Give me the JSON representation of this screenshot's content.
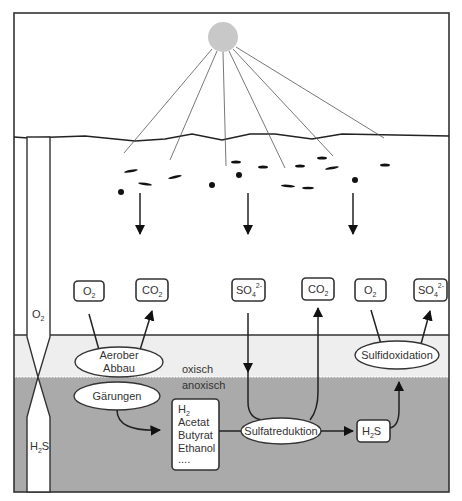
{
  "diagram": {
    "zones": {
      "oxic_label": "oxisch",
      "anoxic_label": "anoxisch"
    },
    "gradient_column": {
      "top_label": "O",
      "top_sub": "2",
      "bottom_label_a": "H",
      "bottom_sub": "2",
      "bottom_label_b": "S"
    },
    "boxes": {
      "o2_left": {
        "main": "O",
        "sub": "2"
      },
      "co2_left": {
        "main": "CO",
        "sub": "2"
      },
      "so4_left": {
        "main": "SO",
        "sub": "4",
        "sup": "2-"
      },
      "co2_mid": {
        "main": "CO",
        "sub": "2"
      },
      "o2_right": {
        "main": "O",
        "sub": "2"
      },
      "so4_right": {
        "main": "SO",
        "sub": "4",
        "sup": "2-"
      },
      "h2s": {
        "main_a": "H",
        "sub": "2",
        "main_b": "S"
      },
      "products": {
        "h2_main": "H",
        "h2_sub": "2",
        "items": [
          "Acetat",
          "Butyrat",
          "Ethanol",
          "...."
        ]
      }
    },
    "processes": {
      "aerober_abbau_line1": "Aerober",
      "aerober_abbau_line2": "Abbau",
      "gaerungen": "Gärungen",
      "sulfatreduktion": "Sulfatreduktion",
      "sulfidoxidation": "Sulfidoxidation"
    },
    "colors": {
      "oxic_zone": "#eeeeee",
      "anoxic_zone": "#aaaaaa",
      "sun": "#c8c8c8",
      "stroke": "#333333"
    }
  }
}
